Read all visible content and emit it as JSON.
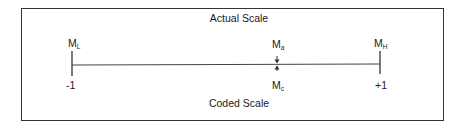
{
  "diagram": {
    "top_label": "Actual Scale",
    "bottom_label": "Coded Scale",
    "left": {
      "symbol": "M",
      "subscript": "L",
      "coded_value": "-1"
    },
    "right": {
      "symbol": "M",
      "subscript": "H",
      "coded_value": "+1"
    },
    "center_top": {
      "symbol": "M",
      "subscript": "a"
    },
    "center_bottom": {
      "symbol": "M",
      "subscript": "c"
    },
    "colors": {
      "line": "#333333",
      "text": "#1a1a1a"
    }
  }
}
